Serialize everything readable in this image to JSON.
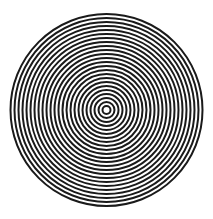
{
  "figure": {
    "type": "concentric-circles",
    "width": 213,
    "height": 219,
    "background": "#ffffff",
    "center": {
      "x": 106.5,
      "y": 110
    },
    "outer_radius": 97,
    "ring_period": 4,
    "stroke_width": 2,
    "ring_color": "#1a1a1a",
    "center_dot_color": "#ffffff"
  }
}
